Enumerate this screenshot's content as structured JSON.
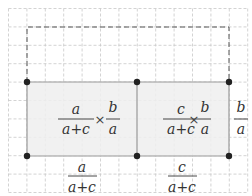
{
  "grid": {
    "origin_x": 8.5,
    "origin_y": 8.5,
    "step": 18.4,
    "cols": 13,
    "rows": 10,
    "color": "#c8c8c8"
  },
  "colors": {
    "shade": "#efefef",
    "edge": "#9a9a9a",
    "dashed": "#555555",
    "dot": "#222222",
    "text": "#333333"
  },
  "points": [
    {
      "id": "top-left",
      "x": 27,
      "y": 82
    },
    {
      "id": "top-middle",
      "x": 137,
      "y": 82
    },
    {
      "id": "top-right",
      "x": 229,
      "y": 82
    },
    {
      "id": "bottom-left",
      "x": 27,
      "y": 156
    },
    {
      "id": "bottom-middle",
      "x": 137,
      "y": 156
    },
    {
      "id": "bottom-right",
      "x": 229,
      "y": 156
    }
  ],
  "dashed_rect": {
    "x1": 27,
    "y1": 27,
    "x2": 229,
    "y2": 82
  },
  "labels": {
    "left_product": {
      "num1": "a",
      "den1": "a+c",
      "op": "×",
      "num2": "b",
      "den2": "a"
    },
    "right_product": {
      "num1": "c",
      "den1": "a+c",
      "op": "×",
      "num2": "b",
      "den2": "a"
    },
    "side_fraction": {
      "num": "b",
      "den": "a"
    },
    "bottom_left": {
      "num": "a",
      "den": "a+c"
    },
    "bottom_right": {
      "num": "c",
      "den": "a+c"
    }
  }
}
